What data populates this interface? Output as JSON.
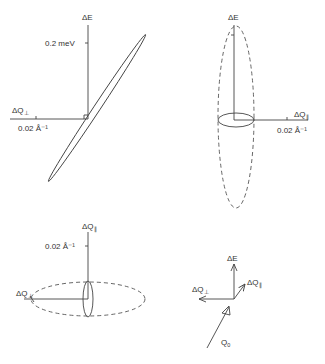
{
  "figure": {
    "panels": [
      {
        "id": "top-left",
        "vertical_axis": {
          "label": "ΔE",
          "tick_label": "0.2 meV"
        },
        "horizontal_axis": {
          "label_main": "ΔQ",
          "label_sub": "⊥",
          "tick_label": "0.02 Å⁻¹"
        },
        "shape": "narrow tilted ellipse"
      },
      {
        "id": "top-right",
        "vertical_axis": {
          "label": "ΔE"
        },
        "horizontal_axis": {
          "label_main": "ΔQ",
          "label_sub": "∥",
          "tick_label": "0.02 Å⁻¹"
        },
        "shape": "solid small ellipse + dashed tall ellipse"
      },
      {
        "id": "bottom-left",
        "vertical_axis": {
          "label_main": "ΔQ",
          "label_sub": "∥",
          "tick_label": "0.02 Å⁻¹"
        },
        "horizontal_axis": {
          "label_main": "ΔQ",
          "label_sub": "⊥"
        },
        "shape": "solid narrow ellipse + dashed wide ellipse"
      },
      {
        "id": "bottom-right",
        "arrows": [
          {
            "label": "ΔE"
          },
          {
            "label_main": "ΔQ",
            "label_sub": "∥"
          },
          {
            "label_main": "ΔQ",
            "label_sub": "⊥"
          },
          {
            "label_main": "Q",
            "label_sub": "0"
          }
        ]
      }
    ]
  },
  "colors": {
    "line": "#444444",
    "text": "#333333",
    "background": "#ffffff"
  }
}
